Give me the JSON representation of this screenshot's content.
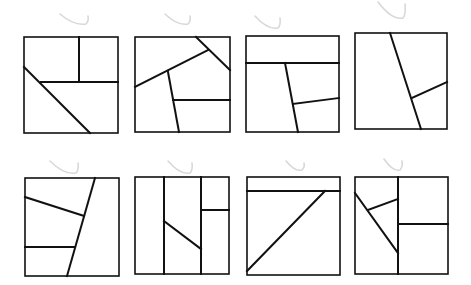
{
  "figure": {
    "width": 471,
    "height": 285,
    "stroke_color": "#111111",
    "mark_color": "#d8d8d8",
    "panels": [
      {
        "id": "panel-1",
        "box": [
          24,
          37,
          118,
          133
        ],
        "lines": [
          [
            79,
            37,
            79,
            82
          ],
          [
            41,
            82,
            118,
            82
          ],
          [
            24,
            67,
            90,
            133
          ]
        ],
        "mark": [
          60,
          14,
          88,
          24
        ]
      },
      {
        "id": "panel-2",
        "box": [
          135,
          37,
          230,
          132
        ],
        "lines": [
          [
            196,
            37,
            230,
            70
          ],
          [
            135,
            87,
            208,
            50
          ],
          [
            168,
            72,
            179,
            132
          ],
          [
            173,
            100,
            230,
            100
          ]
        ],
        "mark": [
          165,
          14,
          190,
          24
        ]
      },
      {
        "id": "panel-3",
        "box": [
          246,
          36,
          339,
          132
        ],
        "lines": [
          [
            246,
            63,
            339,
            63
          ],
          [
            285,
            63,
            298,
            132
          ],
          [
            293,
            104,
            339,
            98
          ]
        ],
        "mark": [
          255,
          16,
          280,
          28
        ]
      },
      {
        "id": "panel-4",
        "box": [
          355,
          33,
          447,
          129
        ],
        "lines": [
          [
            390,
            33,
            421,
            129
          ],
          [
            412,
            98,
            447,
            82
          ]
        ],
        "mark": [
          378,
          2,
          405,
          18
        ]
      },
      {
        "id": "panel-5",
        "box": [
          25,
          178,
          119,
          276
        ],
        "lines": [
          [
            95,
            178,
            67,
            276
          ],
          [
            25,
            197,
            84,
            216
          ],
          [
            25,
            247,
            74,
            247
          ]
        ],
        "mark": [
          50,
          161,
          78,
          173
        ]
      },
      {
        "id": "panel-6",
        "box": [
          135,
          177,
          229,
          274
        ],
        "lines": [
          [
            164,
            177,
            164,
            274
          ],
          [
            201,
            177,
            201,
            274
          ],
          [
            201,
            210,
            229,
            210
          ],
          [
            164,
            221,
            201,
            249
          ]
        ],
        "mark": [
          168,
          161,
          192,
          173
        ]
      },
      {
        "id": "panel-7",
        "box": [
          247,
          177,
          340,
          275
        ],
        "lines": [
          [
            247,
            191,
            340,
            191
          ],
          [
            247,
            271,
            325,
            191
          ]
        ],
        "mark": [
          286,
          161,
          304,
          170
        ]
      },
      {
        "id": "panel-8",
        "box": [
          355,
          177,
          448,
          274
        ],
        "lines": [
          [
            398,
            177,
            398,
            274
          ],
          [
            398,
            224,
            448,
            224
          ],
          [
            355,
            193,
            398,
            253
          ],
          [
            368,
            210,
            398,
            199
          ]
        ],
        "mark": [
          384,
          159,
          402,
          170
        ]
      }
    ]
  }
}
